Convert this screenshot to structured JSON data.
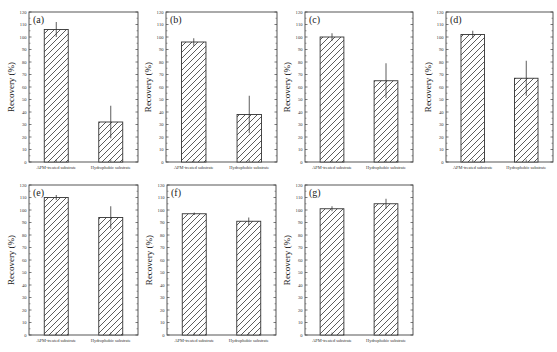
{
  "figure": {
    "ylabel": "Recovery (%)",
    "categories": [
      "APM-treated substrate",
      "Hydrophobic substrate"
    ],
    "yticks": [
      0,
      10,
      20,
      30,
      40,
      50,
      60,
      70,
      80,
      90,
      100,
      110,
      120
    ]
  },
  "chart_data": [
    {
      "type": "bar",
      "panel": "(a)",
      "categories": [
        "APM-treated substrate",
        "Hydrophobic substrate"
      ],
      "values": [
        106,
        32
      ],
      "errors": [
        6,
        13
      ],
      "xlabel": "",
      "ylabel": "Recovery (%)",
      "ylim": [
        0,
        120
      ],
      "grid": false,
      "pattern": "diagonal-hatch"
    },
    {
      "type": "bar",
      "panel": "(b)",
      "categories": [
        "APM-treated substrate",
        "Hydrophobic substrate"
      ],
      "values": [
        96,
        38
      ],
      "errors": [
        3,
        15
      ],
      "xlabel": "",
      "ylabel": "Recovery (%)",
      "ylim": [
        0,
        120
      ],
      "grid": false,
      "pattern": "diagonal-hatch"
    },
    {
      "type": "bar",
      "panel": "(c)",
      "categories": [
        "APM-treated substrate",
        "Hydrophobic substrate"
      ],
      "values": [
        100,
        65
      ],
      "errors": [
        3,
        14
      ],
      "xlabel": "",
      "ylabel": "Recovery (%)",
      "ylim": [
        0,
        120
      ],
      "grid": false,
      "pattern": "diagonal-hatch"
    },
    {
      "type": "bar",
      "panel": "(d)",
      "categories": [
        "APM-treated substrate",
        "Hydrophobic substrate"
      ],
      "values": [
        102,
        67
      ],
      "errors": [
        3,
        14
      ],
      "xlabel": "",
      "ylabel": "Recovery (%)",
      "ylim": [
        0,
        120
      ],
      "grid": false,
      "pattern": "diagonal-hatch"
    },
    {
      "type": "bar",
      "panel": "(e)",
      "categories": [
        "APM-treated substrate",
        "Hydrophobic substrate"
      ],
      "values": [
        110,
        94
      ],
      "errors": [
        2,
        9
      ],
      "xlabel": "",
      "ylabel": "Recovery (%)",
      "ylim": [
        0,
        120
      ],
      "grid": false,
      "pattern": "diagonal-hatch"
    },
    {
      "type": "bar",
      "panel": "(f)",
      "categories": [
        "APM-treated substrate",
        "Hydrophobic substrate"
      ],
      "values": [
        97,
        91
      ],
      "errors": [
        1,
        3
      ],
      "xlabel": "",
      "ylabel": "Recovery (%)",
      "ylim": [
        0,
        120
      ],
      "grid": false,
      "pattern": "diagonal-hatch"
    },
    {
      "type": "bar",
      "panel": "(g)",
      "categories": [
        "APM-treated substrate",
        "Hydrophobic substrate"
      ],
      "values": [
        101,
        105
      ],
      "errors": [
        2,
        4
      ],
      "xlabel": "",
      "ylabel": "Recovery (%)",
      "ylim": [
        0,
        120
      ],
      "grid": false,
      "pattern": "diagonal-hatch"
    }
  ],
  "layout": {
    "panels": [
      {
        "x0": 29,
        "x1": 138,
        "y0": 12,
        "y1": 162
      },
      {
        "x0": 166,
        "x1": 277,
        "y0": 12,
        "y1": 162
      },
      {
        "x0": 305,
        "x1": 413,
        "y0": 12,
        "y1": 162
      },
      {
        "x0": 446,
        "x1": 553,
        "y0": 12,
        "y1": 162
      },
      {
        "x0": 29,
        "x1": 138,
        "y0": 185,
        "y1": 335
      },
      {
        "x0": 167,
        "x1": 276,
        "y0": 185,
        "y1": 335
      },
      {
        "x0": 305,
        "x1": 413,
        "y0": 185,
        "y1": 335
      }
    ]
  }
}
